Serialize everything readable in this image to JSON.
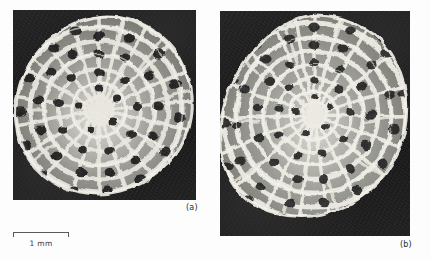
{
  "figure": {
    "type": "micrograph-pair",
    "background_color": "#fdfdfd",
    "panels": [
      {
        "id": "a",
        "caption": "(a)",
        "subject": "honeycomb-skeletal-microstructure",
        "frame_color": "#1a1a1a",
        "strut_color": "#e8e8e4",
        "cell_fill_color": "#8a8a86",
        "pore_color": "#151515"
      },
      {
        "id": "b",
        "caption": "(b)",
        "subject": "honeycomb-skeletal-microstructure",
        "frame_color": "#1a1a1a",
        "strut_color": "#ededea",
        "cell_fill_color": "#8f8f8a",
        "pore_color": "#1a1a1a"
      }
    ]
  },
  "scale_bar": {
    "label": "1 mm",
    "length_px": 56,
    "tick_color": "#5a5a5a",
    "text_color": "#3a3a3a"
  }
}
